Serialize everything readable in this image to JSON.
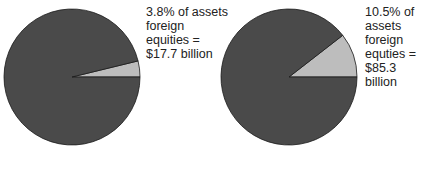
{
  "chart_data": [
    {
      "type": "pie",
      "title": "",
      "slices": [
        {
          "name": "foreign equities",
          "value": 3.8,
          "color": "#bdbdbd"
        },
        {
          "name": "other assets",
          "value": 96.2,
          "color": "#4a4a4a"
        }
      ],
      "annotation": "3.8% of assets\nforeign\nequities =\n$17.7 billion",
      "start_angle_deg": 0,
      "direction": "counterclockwise"
    },
    {
      "type": "pie",
      "title": "",
      "slices": [
        {
          "name": "foreign equities",
          "value": 10.5,
          "color": "#bdbdbd"
        },
        {
          "name": "other assets",
          "value": 89.5,
          "color": "#4a4a4a"
        }
      ],
      "annotation": "10.5% of\nassets\nforeign\nequties =\n$85.3 billion",
      "start_angle_deg": 0,
      "direction": "counterclockwise"
    }
  ],
  "colors": {
    "main": "#4a4a4a",
    "highlight": "#bdbdbd",
    "outline": "#1a1a1a"
  }
}
